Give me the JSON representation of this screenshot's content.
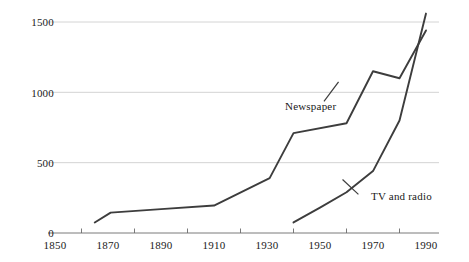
{
  "chart_data": {
    "type": "line",
    "title": "",
    "subtitle": "",
    "xlabel": "",
    "ylabel": "",
    "xlim": [
      1850,
      1990
    ],
    "ylim": [
      0,
      1500
    ],
    "xticks": [
      1850,
      1870,
      1890,
      1910,
      1930,
      1950,
      1970,
      1990
    ],
    "xtick_labels": [
      "1850",
      "1870",
      "1890",
      "1910",
      "1930",
      "1950",
      "1970",
      "1990"
    ],
    "minor_xtick_step": 10,
    "yticks": [
      0,
      500,
      1000,
      1500
    ],
    "ytick_labels": [
      "0",
      "500",
      "1000",
      "1500"
    ],
    "grid": "horizontal",
    "legend_position": "inline-annotation",
    "line_color": "#3d3d3d",
    "grid_color": "#cfcfcf",
    "axis_color": "#6b6b6b",
    "background": "#ffffff",
    "series": [
      {
        "name": "Newspaper",
        "label": "Newspaper",
        "label_x": 1928,
        "label_y": 1010,
        "x": [
          1865,
          1871,
          1890,
          1910,
          1931,
          1940,
          1960,
          1970,
          1980,
          1990
        ],
        "values": [
          75,
          145,
          170,
          195,
          390,
          710,
          780,
          1150,
          1100,
          1440
        ]
      },
      {
        "name": "TV and radio",
        "label": "TV and radio",
        "label_x": 1966,
        "label_y": 310,
        "x": [
          1940,
          1950,
          1960,
          1970,
          1980,
          1990
        ],
        "values": [
          75,
          180,
          290,
          440,
          800,
          1560
        ]
      }
    ]
  }
}
